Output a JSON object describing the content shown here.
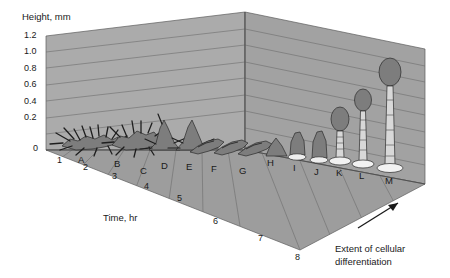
{
  "figure": {
    "type": "3d-developmental-morphology-diagram",
    "y_axis": {
      "title": "Height, mm",
      "ticks": [
        "1.2",
        "1.0",
        "0.8",
        "0.6",
        "0.4",
        "0.2",
        "0"
      ],
      "values": [
        1.2,
        1.0,
        0.8,
        0.6,
        0.4,
        0.2,
        0
      ],
      "min": 0,
      "max": 1.3
    },
    "x_axis": {
      "title": "Time, hr",
      "ticks": [
        "1",
        "2",
        "3",
        "4",
        "5",
        "6",
        "7",
        "8"
      ],
      "values": [
        1,
        2,
        3,
        4,
        5,
        6,
        7,
        8
      ],
      "min": 0,
      "max": 8
    },
    "annotation": {
      "line1": "Extent of cellular",
      "line2": "differentiation",
      "arrow": "up-right-arrow"
    },
    "colors": {
      "back_wall": "#ababab",
      "right_wall": "#a0a0a0",
      "floor": "#9d9d9d",
      "grid_line": "#6d6d6d",
      "outline": "#3a3a3a",
      "organism_fill": "#8a8a8a",
      "organism_dark": "#5e5e5e",
      "stalk_light": "#e8e8e8",
      "ink": "#1a1a1a"
    },
    "stages": [
      {
        "id": "A",
        "label": "A",
        "form": "aggregation-stream",
        "time_hr": 1.2,
        "height_mm": 0.16
      },
      {
        "id": "B",
        "label": "B",
        "form": "aggregation-stream",
        "time_hr": 2.3,
        "height_mm": 0.18
      },
      {
        "id": "C",
        "label": "C",
        "form": "tipped-mound",
        "time_hr": 3.1,
        "height_mm": 0.3
      },
      {
        "id": "D",
        "label": "D",
        "form": "tipped-mound",
        "time_hr": 3.6,
        "height_mm": 0.26
      },
      {
        "id": "E",
        "label": "E",
        "form": "migrating-slug",
        "time_hr": 4.2,
        "height_mm": 0.14
      },
      {
        "id": "F",
        "label": "F",
        "form": "migrating-slug",
        "time_hr": 4.7,
        "height_mm": 0.14
      },
      {
        "id": "G",
        "label": "G",
        "form": "migrating-slug",
        "time_hr": 5.2,
        "height_mm": 0.13
      },
      {
        "id": "H",
        "label": "H",
        "form": "mexican-hat",
        "time_hr": 5.7,
        "height_mm": 0.18
      },
      {
        "id": "I",
        "label": "I",
        "form": "early-culminant",
        "time_hr": 6.1,
        "height_mm": 0.24
      },
      {
        "id": "J",
        "label": "J",
        "form": "early-culminant",
        "time_hr": 6.5,
        "height_mm": 0.26
      },
      {
        "id": "K",
        "label": "K",
        "form": "mid-culminant",
        "time_hr": 6.9,
        "height_mm": 0.56
      },
      {
        "id": "L",
        "label": "L",
        "form": "late-culminant",
        "time_hr": 7.3,
        "height_mm": 0.8
      },
      {
        "id": "M",
        "label": "M",
        "form": "mature-fruiting-body",
        "time_hr": 7.7,
        "height_mm": 1.1
      }
    ]
  }
}
